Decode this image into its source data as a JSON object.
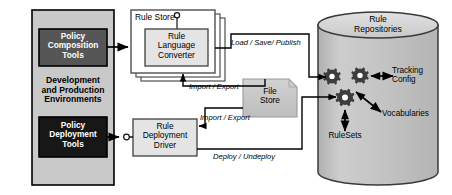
{
  "diagram": {
    "colors": {
      "env_container_fill": "#c9c9c9",
      "env_container_stroke": "#000000",
      "composition_fill": "#565656",
      "deployment_fill": "#171717",
      "rule_store_fill": "#ffffff",
      "rule_store_stroke": "#555555",
      "converter_fill": "#e4e4e4",
      "converter_stroke": "#444444",
      "driver_fill": "#e4e4e4",
      "driver_stroke": "#444444",
      "file_store_fill": "#c5c5c5",
      "file_store_stroke": "#9a9a9a",
      "cylinder_fill": "#c2c2c2",
      "cylinder_top_fill": "#d8d8d8",
      "cylinder_stroke": "#3a3a3a",
      "gear_fill": "#3d3d3d",
      "arrow": "#000000",
      "text_light": "#ffffff",
      "text_dark": "#000000"
    },
    "environment": {
      "name": "Development and Production Environments",
      "label": "Development\nand Production\nEnvironments",
      "boxes": [
        {
          "id": "policy-composition-tools",
          "label": "Policy\nComposition\nTools"
        },
        {
          "id": "policy-deployment-tools",
          "label": "Policy\nDeployment\nTools"
        }
      ]
    },
    "rule_store": {
      "title": "Rule Store",
      "converter": {
        "label": "Rule\nLanguage\nConverter"
      }
    },
    "rule_deployment_driver": {
      "label": "Rule\nDeployment\nDriver"
    },
    "file_store": {
      "label": "File\nStore"
    },
    "repository": {
      "title": "Rule\nRepositories",
      "artifacts": [
        {
          "id": "tracking-config",
          "label": "Tracking\nConfig"
        },
        {
          "id": "vocabularies",
          "label": "Vocabularies"
        },
        {
          "id": "rulesets",
          "label": "RuleSets"
        }
      ]
    },
    "edge_labels": [
      {
        "id": "load-save-publish",
        "label": "Load / Save/ Publish"
      },
      {
        "id": "import-export-top",
        "label": "Import / Export"
      },
      {
        "id": "import-export-bottom",
        "label": "Import / Export"
      },
      {
        "id": "deploy-undeploy",
        "label": "Deploy / Undeploy"
      }
    ]
  }
}
